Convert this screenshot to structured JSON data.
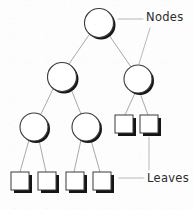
{
  "diagram": {
    "type": "tree-diagram",
    "canvas": {
      "width": 193,
      "height": 210,
      "background": "#fdfdfd"
    },
    "style": {
      "node_stroke": "#3a3a3a",
      "node_fill": "#ffffff",
      "node_shadow": "#111111",
      "leaf_stroke": "#3a3a3a",
      "leaf_fill": "#ffffff",
      "leaf_shadow": "#111111",
      "edge_color": "#a9a9a9",
      "leader_color": "#b0b0b0",
      "text_color": "#2b2b2b"
    },
    "labels": {
      "nodes": "Nodes",
      "leaves": "Leaves"
    },
    "nodes": [
      {
        "id": "root",
        "shape": "circle",
        "cx": 99,
        "cy": 23,
        "r": 14.5,
        "level": 0
      },
      {
        "id": "n-l",
        "shape": "circle",
        "cx": 62,
        "cy": 77,
        "r": 14.5,
        "level": 1
      },
      {
        "id": "n-r",
        "shape": "circle",
        "cx": 138,
        "cy": 79,
        "r": 14,
        "level": 1
      },
      {
        "id": "n-ll",
        "shape": "circle",
        "cx": 34,
        "cy": 127,
        "r": 14,
        "level": 2
      },
      {
        "id": "n-lr",
        "shape": "circle",
        "cx": 86,
        "cy": 127,
        "r": 14,
        "level": 2
      }
    ],
    "leaves": [
      {
        "id": "leaf-1",
        "shape": "square",
        "x": 115,
        "y": 115,
        "w": 18,
        "h": 18,
        "level": 2
      },
      {
        "id": "leaf-2",
        "shape": "square",
        "x": 140,
        "y": 115,
        "w": 18,
        "h": 18,
        "level": 2
      },
      {
        "id": "leaf-3",
        "shape": "square",
        "x": 11,
        "y": 172,
        "w": 18,
        "h": 18,
        "level": 3
      },
      {
        "id": "leaf-4",
        "shape": "square",
        "x": 38,
        "y": 172,
        "w": 18,
        "h": 18,
        "level": 3
      },
      {
        "id": "leaf-5",
        "shape": "square",
        "x": 66,
        "y": 172,
        "w": 18,
        "h": 18,
        "level": 3
      },
      {
        "id": "leaf-6",
        "shape": "square",
        "x": 93,
        "y": 172,
        "w": 18,
        "h": 18,
        "level": 3
      }
    ],
    "edges": [
      {
        "from": "root",
        "to": "n-l",
        "x1": 89,
        "y1": 35,
        "x2": 69,
        "y2": 64
      },
      {
        "from": "root",
        "to": "n-r",
        "x1": 109,
        "y1": 35,
        "x2": 131,
        "y2": 67
      },
      {
        "from": "n-l",
        "to": "n-ll",
        "x1": 53,
        "y1": 89,
        "x2": 41,
        "y2": 114
      },
      {
        "from": "n-l",
        "to": "n-lr",
        "x1": 71,
        "y1": 89,
        "x2": 81,
        "y2": 114
      },
      {
        "from": "n-r",
        "to": "leaf-1",
        "x1": 135,
        "y1": 93,
        "x2": 125,
        "y2": 115
      },
      {
        "from": "n-r",
        "to": "leaf-2",
        "x1": 140,
        "y1": 93,
        "x2": 148,
        "y2": 115
      },
      {
        "from": "n-ll",
        "to": "leaf-3",
        "x1": 29,
        "y1": 140,
        "x2": 20,
        "y2": 172
      },
      {
        "from": "n-ll",
        "to": "leaf-4",
        "x1": 39,
        "y1": 140,
        "x2": 46,
        "y2": 172
      },
      {
        "from": "n-lr",
        "to": "leaf-5",
        "x1": 81,
        "y1": 140,
        "x2": 74,
        "y2": 172
      },
      {
        "from": "n-lr",
        "to": "leaf-6",
        "x1": 91,
        "y1": 140,
        "x2": 100,
        "y2": 172
      }
    ],
    "leader_lines": [
      {
        "id": "leader-nodes-root",
        "x1": 118,
        "y1": 19,
        "x2": 143,
        "y2": 19
      },
      {
        "id": "leader-nodes-right",
        "x1": 148,
        "y1": 28,
        "x2": 138,
        "y2": 64
      },
      {
        "id": "leader-leaves-drop",
        "x1": 149,
        "y1": 136,
        "x2": 149,
        "y2": 170
      },
      {
        "id": "leader-leaves-horz",
        "x1": 119,
        "y1": 178,
        "x2": 144,
        "y2": 178
      }
    ]
  }
}
